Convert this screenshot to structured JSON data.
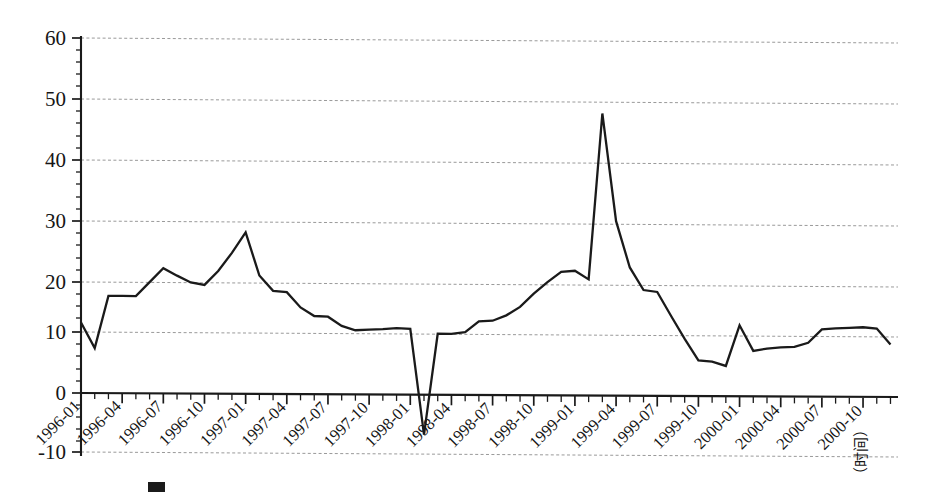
{
  "chart_data": {
    "type": "line",
    "title": "",
    "xlabel": "（时间）",
    "ylabel": "",
    "ylim": [
      -10,
      60
    ],
    "yticks": [
      -10,
      0,
      10,
      20,
      30,
      40,
      50,
      60
    ],
    "ytick_labels": [
      "-10",
      "0",
      "10",
      "20",
      "30",
      "40",
      "50",
      "60"
    ],
    "grid": "horizontal-dashed",
    "legend": "none",
    "minor_ticks": "monthly",
    "x": [
      "1996-01",
      "1996-02",
      "1996-03",
      "1996-04",
      "1996-05",
      "1996-06",
      "1996-07",
      "1996-08",
      "1996-09",
      "1996-10",
      "1996-11",
      "1996-12",
      "1997-01",
      "1997-02",
      "1997-03",
      "1997-04",
      "1997-05",
      "1997-06",
      "1997-07",
      "1997-08",
      "1997-09",
      "1997-10",
      "1997-11",
      "1997-12",
      "1998-01",
      "1998-02",
      "1998-03",
      "1998-04",
      "1998-05",
      "1998-06",
      "1998-07",
      "1998-08",
      "1998-09",
      "1998-10",
      "1998-11",
      "1998-12",
      "1999-01",
      "1999-02",
      "1999-03",
      "1999-04",
      "1999-05",
      "1999-06",
      "1999-07",
      "1999-08",
      "1999-09",
      "1999-10",
      "1999-11",
      "1999-12",
      "2000-01",
      "2000-02",
      "2000-03",
      "2000-04",
      "2000-05",
      "2000-06",
      "2000-07",
      "2000-08",
      "2000-09",
      "2000-10",
      "2000-11",
      "2000-12"
    ],
    "xtick_labels": [
      "1996-01",
      "1996-04",
      "1996-07",
      "1996-10",
      "1997-01",
      "1997-04",
      "1997-07",
      "1997-10",
      "1998-01",
      "1998-04",
      "1998-07",
      "1998-10",
      "1999-01",
      "1999-04",
      "1999-07",
      "1999-10",
      "2000-01",
      "2000-04",
      "2000-07",
      "2000-10"
    ],
    "values": [
      11.6,
      7.4,
      16.0,
      16.0,
      16.0,
      18.3,
      20.6,
      19.4,
      18.3,
      17.9,
      20.2,
      23.2,
      26.6,
      19.5,
      17.0,
      16.8,
      14.3,
      12.9,
      12.8,
      11.3,
      10.6,
      10.7,
      10.8,
      11.0,
      10.9,
      -6.5,
      10.1,
      10.1,
      10.4,
      12.2,
      12.3,
      13.2,
      14.6,
      16.8,
      18.7,
      20.4,
      20.6,
      19.2,
      46.5,
      28.8,
      21.2,
      17.5,
      17.2,
      13.3,
      9.5,
      6.0,
      5.8,
      5.1,
      11.8,
      7.6,
      8.0,
      8.2,
      8.3,
      9.0,
      11.2,
      11.4,
      11.5,
      11.6,
      11.4,
      8.8
    ],
    "series_name": "",
    "line_color": "#1a1a1a",
    "grid_color": "#999999"
  },
  "axis": {
    "x_axis_title": "（时间）",
    "y_tick_labels": [
      "60",
      "50",
      "40",
      "30",
      "20",
      "10",
      "0",
      "-10"
    ],
    "x_tick_labels": [
      "1996-01",
      "1996-04",
      "1996-07",
      "1996-10",
      "1997-01",
      "1997-04",
      "1997-07",
      "1997-10",
      "1998-01",
      "1998-04",
      "1998-07",
      "1998-10",
      "1999-01",
      "1999-04",
      "1999-07",
      "1999-10",
      "2000-01",
      "2000-04",
      "2000-07",
      "2000-10"
    ]
  },
  "caption": {
    "marker": "figure-caption-marker",
    "text": ""
  }
}
